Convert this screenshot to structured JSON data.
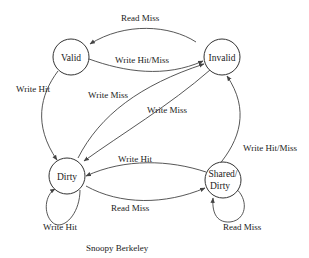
{
  "diagram": {
    "type": "state-transition",
    "caption": "Snoopy Berkeley",
    "nodes": {
      "valid": {
        "label": "Valid"
      },
      "invalid": {
        "label": "Invalid"
      },
      "dirty": {
        "label": "Dirty"
      },
      "shared_dirty": {
        "line1": "Shared/",
        "line2": "Dirty"
      }
    },
    "edges": {
      "invalid_to_valid": {
        "from": "Invalid",
        "to": "Valid",
        "label": "Read Miss"
      },
      "valid_to_invalid": {
        "from": "Valid",
        "to": "Invalid",
        "label": "Write Hit/Miss"
      },
      "valid_to_dirty": {
        "from": "Valid",
        "to": "Dirty",
        "label": "Write Hit"
      },
      "dirty_to_invalid": {
        "from": "Dirty",
        "to": "Invalid",
        "label": "Write Miss"
      },
      "invalid_to_dirty": {
        "from": "Invalid",
        "to": "Dirty",
        "label": "Write Miss"
      },
      "shared_to_dirty": {
        "from": "Shared/Dirty",
        "to": "Dirty",
        "label": "Write Hit"
      },
      "dirty_to_shared": {
        "from": "Dirty",
        "to": "Shared/Dirty",
        "label": "Read Miss"
      },
      "shared_to_invalid": {
        "from": "Shared/Dirty",
        "to": "Invalid",
        "label": "Write Hit/Miss"
      },
      "dirty_self": {
        "from": "Dirty",
        "to": "Dirty",
        "label": "Write Hit"
      },
      "shared_self": {
        "from": "Shared/Dirty",
        "to": "Shared/Dirty",
        "label": "Read Miss"
      }
    }
  }
}
